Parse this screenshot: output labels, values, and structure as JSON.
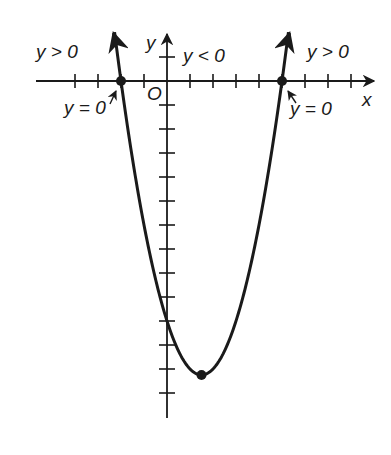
{
  "chart_data": {
    "type": "line",
    "title": "",
    "function": "y = (x + 2)(x - 5)",
    "roots": [
      -2,
      5
    ],
    "vertex": {
      "x": 1.5,
      "y": -12.25
    },
    "x_ticks": [
      -4,
      -3,
      -2,
      -1,
      1,
      2,
      3,
      4,
      5,
      6,
      7,
      8
    ],
    "y_ticks": [
      1,
      -1,
      -2,
      -3,
      -4,
      -5,
      -6,
      -7,
      -8,
      -9,
      -10,
      -11,
      -12,
      -13
    ],
    "xlim": [
      -4.5,
      9
    ],
    "ylim": [
      -14.5,
      2
    ],
    "grid": false,
    "xlabel": "x",
    "ylabel": "y",
    "origin_label": "O",
    "points": [
      {
        "x": -2,
        "y": 0,
        "label": "y = 0"
      },
      {
        "x": 5,
        "y": 0,
        "label": "y = 0"
      },
      {
        "x": 1.5,
        "y": -12.25,
        "label": ""
      }
    ],
    "annotations": [
      {
        "text": "y > 0",
        "region": "x < -2"
      },
      {
        "text": "y < 0",
        "region": "-2 < x < 5"
      },
      {
        "text": "y > 0",
        "region": "x > 5"
      }
    ]
  },
  "labels": {
    "x_axis": "x",
    "y_axis": "y",
    "origin": "O",
    "left_region": "y > 0",
    "middle_region": "y < 0",
    "right_region": "y > 0",
    "left_root": "y = 0",
    "right_root": "y = 0"
  },
  "colors": {
    "ink": "#1a1a1a",
    "background": "#ffffff"
  }
}
